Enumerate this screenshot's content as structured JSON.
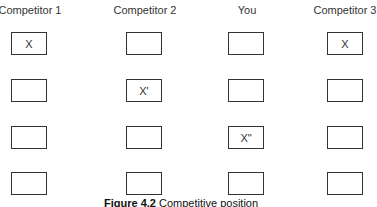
{
  "columns": [
    {
      "label": "Competitor 1",
      "x": 30,
      "cells": [
        "X",
        "",
        "",
        ""
      ]
    },
    {
      "label": "Competitor 2",
      "x": 145,
      "cells": [
        "",
        "X'",
        "",
        ""
      ]
    },
    {
      "label": "You",
      "x": 247,
      "cells": [
        "",
        "",
        "X\"",
        ""
      ]
    },
    {
      "label": "Competitor 3",
      "x": 345,
      "cells": [
        "X",
        "",
        "",
        ""
      ]
    }
  ],
  "caption": {
    "label": "Figure 4.2",
    "text": "Competitive position"
  }
}
